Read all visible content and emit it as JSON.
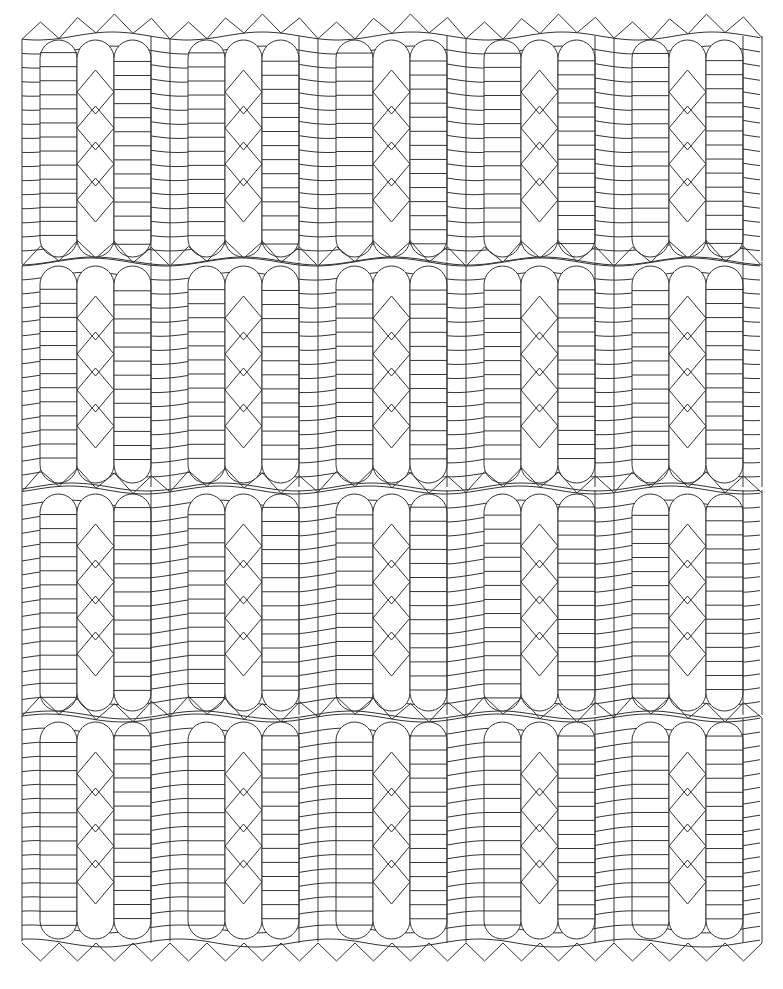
{
  "pattern": {
    "type": "quilting-line-art",
    "background": "#ffffff",
    "stroke": "#333333",
    "grid": {
      "columns": 5,
      "rows": 4
    },
    "origin": {
      "x": 22,
      "y": 36
    },
    "block": {
      "width": 148,
      "height": 225
    },
    "rows_y": [
      36,
      262,
      490,
      718
    ],
    "row_height": 225,
    "strip_width": 18,
    "pill_width": 37,
    "diamonds_per_block": 4,
    "lines_per_block": 16,
    "zigzag": {
      "teeth_per_block": 4,
      "height": 18
    }
  }
}
